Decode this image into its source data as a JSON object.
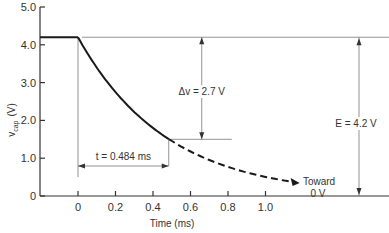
{
  "chart_data": {
    "type": "line",
    "title": "",
    "xlabel": "Time (ms)",
    "ylabel_main": "v",
    "ylabel_sub": "cap",
    "ylabel_unit": "(V)",
    "xlim": [
      -0.2,
      1.6
    ],
    "ylim": [
      0,
      5.0
    ],
    "x_ticks": [
      {
        "value": 0,
        "label": "0"
      },
      {
        "value": 0.2,
        "label": "0.2"
      },
      {
        "value": 0.4,
        "label": "0.4"
      },
      {
        "value": 0.6,
        "label": "0.6"
      },
      {
        "value": 0.8,
        "label": "0.8"
      },
      {
        "value": 1.0,
        "label": "1.0"
      }
    ],
    "y_ticks": [
      {
        "value": 0,
        "label": "0"
      },
      {
        "value": 1.0,
        "label": "1.0"
      },
      {
        "value": 2.0,
        "label": "2.0"
      },
      {
        "value": 3.0,
        "label": "3.0"
      },
      {
        "value": 4.0,
        "label": "4.0"
      },
      {
        "value": 5.0,
        "label": "5.0"
      }
    ],
    "grid": false,
    "series": [
      {
        "name": "initial-voltage",
        "style": "solid",
        "x": [
          -0.2,
          0
        ],
        "y": [
          4.2,
          4.2
        ]
      },
      {
        "name": "discharge-solid",
        "style": "solid",
        "function": "E*exp(-t/tau)",
        "E": 4.2,
        "tau_ms": 0.472,
        "t_range": [
          0,
          0.484
        ]
      },
      {
        "name": "discharge-dashed",
        "style": "dashed",
        "function": "E*exp(-t/tau)",
        "E": 4.2,
        "tau_ms": 0.472,
        "t_range": [
          0.484,
          1.15
        ]
      }
    ],
    "annotations": {
      "delta_v": {
        "text": "Δv = 2.7 V",
        "from": 4.2,
        "to": 1.5,
        "at_t": 0.66
      },
      "elapsed": {
        "text": "t = 0.484 ms",
        "from": 0,
        "to": 0.484
      },
      "source": {
        "text": "E = 4.2 V",
        "from": 4.2,
        "to": 0,
        "at_t": 1.5
      },
      "toward_line1": "Toward",
      "toward_line2": "0 V"
    },
    "reference_levels": {
      "E": 4.2,
      "v_final": 1.5
    }
  }
}
